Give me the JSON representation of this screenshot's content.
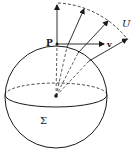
{
  "diagram": {
    "labels": {
      "point": "P",
      "vector": "v",
      "region": "U",
      "surface": "Σ"
    },
    "colors": {
      "stroke": "#1a1a1a",
      "background": "#ffffff"
    },
    "geometry": {
      "sphere_center": [
        56,
        96
      ],
      "sphere_radius": 51,
      "point_P": [
        57,
        44
      ],
      "arc_U": {
        "from": [
          58,
          3
        ],
        "to": [
          128,
          40
        ]
      }
    }
  }
}
